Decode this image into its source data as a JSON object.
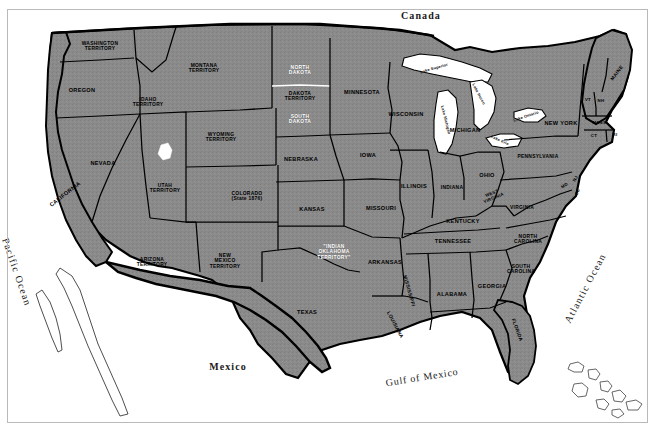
{
  "map": {
    "title": "United States circa 1880s with Territories",
    "colors": {
      "land": "#8a8a8a",
      "land_dark": "#7c7c7c",
      "water": "#ffffff",
      "border": "#000000",
      "frame": "#b9b9b9",
      "label_dark": "#000000",
      "label_light": "#ffffff"
    },
    "countries": [
      {
        "name": "canada-label",
        "text": "Canada",
        "x": 421,
        "y": 15,
        "rotate": 0
      },
      {
        "name": "mexico-label",
        "text": "Mexico",
        "x": 228,
        "y": 366,
        "rotate": 0
      }
    ],
    "waters": [
      {
        "name": "pacific-ocean-label",
        "text": "Pacific Ocean",
        "x": 17,
        "y": 272,
        "rotate": 71
      },
      {
        "name": "atlantic-ocean-label",
        "text": "Atlantic Ocean",
        "x": 585,
        "y": 288,
        "rotate": -62
      },
      {
        "name": "gulf-of-mexico-label",
        "text": "Gulf of Mexico",
        "x": 422,
        "y": 377,
        "rotate": -9
      }
    ],
    "lakes": [
      {
        "name": "lake-superior-label",
        "text": "Lake Superior",
        "x": 434,
        "y": 68,
        "rotate": -16
      },
      {
        "name": "lake-michigan-label",
        "text": "Lake Michigan",
        "x": 446,
        "y": 120,
        "rotate": 76
      },
      {
        "name": "lake-huron-label",
        "text": "Lake Huron",
        "x": 479,
        "y": 94,
        "rotate": 62
      },
      {
        "name": "lake-erie-label",
        "text": "Lake Erie",
        "x": 500,
        "y": 140,
        "rotate": 25
      },
      {
        "name": "lake-ontario-label",
        "text": "Lake Ontario",
        "x": 526,
        "y": 116,
        "rotate": -19
      }
    ],
    "regions": [
      {
        "name": "washington-territory",
        "text": "WASHINGTON\nTERRITORY",
        "x": 100,
        "y": 46,
        "size": "small",
        "light": false,
        "rotate": 0
      },
      {
        "name": "oregon",
        "text": "OREGON",
        "x": 82,
        "y": 90,
        "size": "state",
        "light": false,
        "rotate": 0
      },
      {
        "name": "idaho-territory",
        "text": "IDAHO\nTERRITORY",
        "x": 148,
        "y": 102,
        "size": "small",
        "light": false,
        "rotate": 0
      },
      {
        "name": "montana-territory",
        "text": "MONTANA\nTERRITORY",
        "x": 204,
        "y": 68,
        "size": "small",
        "light": false,
        "rotate": 0
      },
      {
        "name": "wyoming-territory",
        "text": "WYOMING\nTERRITORY",
        "x": 221,
        "y": 137,
        "size": "small",
        "light": false,
        "rotate": 0
      },
      {
        "name": "nevada",
        "text": "NEVADA",
        "x": 103,
        "y": 163,
        "size": "state",
        "light": false,
        "rotate": 0
      },
      {
        "name": "california",
        "text": "CALIFORNIA",
        "x": 65,
        "y": 194,
        "size": "state",
        "light": false,
        "rotate": -38
      },
      {
        "name": "utah-territory",
        "text": "UTAH\nTERRITORY",
        "x": 165,
        "y": 188,
        "size": "small",
        "light": false,
        "rotate": 0
      },
      {
        "name": "colorado",
        "text": "COLORADO\n(State 1876)",
        "x": 247,
        "y": 196,
        "size": "small",
        "light": false,
        "rotate": 0
      },
      {
        "name": "arizona-territory",
        "text": "ARIZONA\nTERRITORY",
        "x": 152,
        "y": 262,
        "size": "small",
        "light": false,
        "rotate": 0
      },
      {
        "name": "new-mexico-territory",
        "text": "NEW\nMEXICO\nTERRITORY",
        "x": 225,
        "y": 261,
        "size": "small",
        "light": false,
        "rotate": 0
      },
      {
        "name": "texas",
        "text": "TEXAS",
        "x": 307,
        "y": 312,
        "size": "state",
        "light": false,
        "rotate": 0
      },
      {
        "name": "north-dakota",
        "text": "NORTH\nDAKOTA",
        "x": 300,
        "y": 70,
        "size": "small",
        "light": true,
        "rotate": 0
      },
      {
        "name": "dakota-territory",
        "text": "DAKOTA\nTERRITORY",
        "x": 300,
        "y": 96,
        "size": "small",
        "light": false,
        "rotate": 0
      },
      {
        "name": "south-dakota",
        "text": "SOUTH\nDAKOTA",
        "x": 300,
        "y": 119,
        "size": "small",
        "light": true,
        "rotate": 0
      },
      {
        "name": "nebraska",
        "text": "NEBRASKA",
        "x": 301,
        "y": 159,
        "size": "state",
        "light": false,
        "rotate": 0
      },
      {
        "name": "kansas",
        "text": "KANSAS",
        "x": 312,
        "y": 209,
        "size": "state",
        "light": false,
        "rotate": 0
      },
      {
        "name": "minnesota",
        "text": "MINNESOTA",
        "x": 362,
        "y": 92,
        "size": "state",
        "light": false,
        "rotate": 0
      },
      {
        "name": "iowa",
        "text": "IOWA",
        "x": 368,
        "y": 155,
        "size": "state",
        "light": false,
        "rotate": 0
      },
      {
        "name": "missouri",
        "text": "MISSOURI",
        "x": 381,
        "y": 208,
        "size": "state",
        "light": false,
        "rotate": 0
      },
      {
        "name": "wisconsin",
        "text": "WISCONSIN",
        "x": 406,
        "y": 114,
        "size": "state",
        "light": false,
        "rotate": 0
      },
      {
        "name": "illinois",
        "text": "ILLINOIS",
        "x": 414,
        "y": 186,
        "size": "state",
        "light": false,
        "rotate": 0
      },
      {
        "name": "michigan",
        "text": "MICHIGAN",
        "x": 465,
        "y": 130,
        "size": "state",
        "light": false,
        "rotate": 0
      },
      {
        "name": "indiana",
        "text": "INDIANA",
        "x": 452,
        "y": 188,
        "size": "small",
        "light": false,
        "rotate": 0
      },
      {
        "name": "ohio",
        "text": "OHIO",
        "x": 487,
        "y": 175,
        "size": "state",
        "light": false,
        "rotate": 0
      },
      {
        "name": "indian-oklahoma-territory",
        "text": "\"INDIAN\nOKLAHOMA\nTERRITORY\"",
        "x": 334,
        "y": 252,
        "size": "small",
        "light": true,
        "rotate": 0
      },
      {
        "name": "arkansas",
        "text": "ARKANSAS",
        "x": 385,
        "y": 262,
        "size": "state",
        "light": false,
        "rotate": 0
      },
      {
        "name": "louisiana",
        "text": "LOUISIANA",
        "x": 395,
        "y": 325,
        "size": "small",
        "light": false,
        "rotate": 62
      },
      {
        "name": "mississippi",
        "text": "MISSISSIPPI",
        "x": 409,
        "y": 291,
        "size": "small",
        "light": false,
        "rotate": 74
      },
      {
        "name": "alabama",
        "text": "ALABAMA",
        "x": 452,
        "y": 294,
        "size": "state",
        "light": false,
        "rotate": 0
      },
      {
        "name": "georgia",
        "text": "GEORGIA",
        "x": 492,
        "y": 286,
        "size": "state",
        "light": false,
        "rotate": 0
      },
      {
        "name": "florida",
        "text": "FLORIDA",
        "x": 517,
        "y": 330,
        "size": "small",
        "light": false,
        "rotate": 70
      },
      {
        "name": "tennessee",
        "text": "TENNESSEE",
        "x": 453,
        "y": 241,
        "size": "state",
        "light": false,
        "rotate": 0
      },
      {
        "name": "kentucky",
        "text": "KENTUCKY",
        "x": 463,
        "y": 221,
        "size": "state",
        "light": false,
        "rotate": 0
      },
      {
        "name": "west-virginia",
        "text": "WEST\nVIRGINIA",
        "x": 493,
        "y": 196,
        "size": "tiny",
        "light": false,
        "rotate": -22
      },
      {
        "name": "virginia",
        "text": "VIRGINIA",
        "x": 522,
        "y": 208,
        "size": "small",
        "light": false,
        "rotate": 0
      },
      {
        "name": "north-carolina",
        "text": "NORTH\nCAROLINA",
        "x": 528,
        "y": 239,
        "size": "small",
        "light": false,
        "rotate": 0
      },
      {
        "name": "south-carolina",
        "text": "SOUTH\nCAROLINA",
        "x": 521,
        "y": 269,
        "size": "small",
        "light": false,
        "rotate": 0
      },
      {
        "name": "pennsylvania",
        "text": "PENNSYLVANIA",
        "x": 538,
        "y": 157,
        "size": "small",
        "light": false,
        "rotate": 0
      },
      {
        "name": "new-york",
        "text": "NEW YORK",
        "x": 561,
        "y": 123,
        "size": "state",
        "light": false,
        "rotate": 0
      },
      {
        "name": "maine",
        "text": "MAINE",
        "x": 617,
        "y": 73,
        "size": "small",
        "light": false,
        "rotate": -52
      },
      {
        "name": "vermont",
        "text": "VT",
        "x": 588,
        "y": 100,
        "size": "tiny",
        "light": false,
        "rotate": 0
      },
      {
        "name": "new-hampshire",
        "text": "NH",
        "x": 601,
        "y": 101,
        "size": "tiny",
        "light": false,
        "rotate": 0
      },
      {
        "name": "massachusetts",
        "text": "MASS.",
        "x": 600,
        "y": 123,
        "size": "tiny",
        "light": false,
        "rotate": 0
      },
      {
        "name": "connecticut",
        "text": "CT",
        "x": 594,
        "y": 136,
        "size": "tiny",
        "light": false,
        "rotate": 0
      },
      {
        "name": "rhode-island",
        "text": "RI",
        "x": 615,
        "y": 135,
        "size": "tiny",
        "light": false,
        "rotate": 0
      },
      {
        "name": "new-jersey",
        "text": "NJ",
        "x": 576,
        "y": 179,
        "size": "tiny",
        "light": false,
        "rotate": -58
      },
      {
        "name": "delaware",
        "text": "DE",
        "x": 578,
        "y": 192,
        "size": "tiny",
        "light": false,
        "rotate": -70
      },
      {
        "name": "maryland",
        "text": "MD",
        "x": 565,
        "y": 186,
        "size": "tiny",
        "light": false,
        "rotate": -34
      }
    ]
  }
}
